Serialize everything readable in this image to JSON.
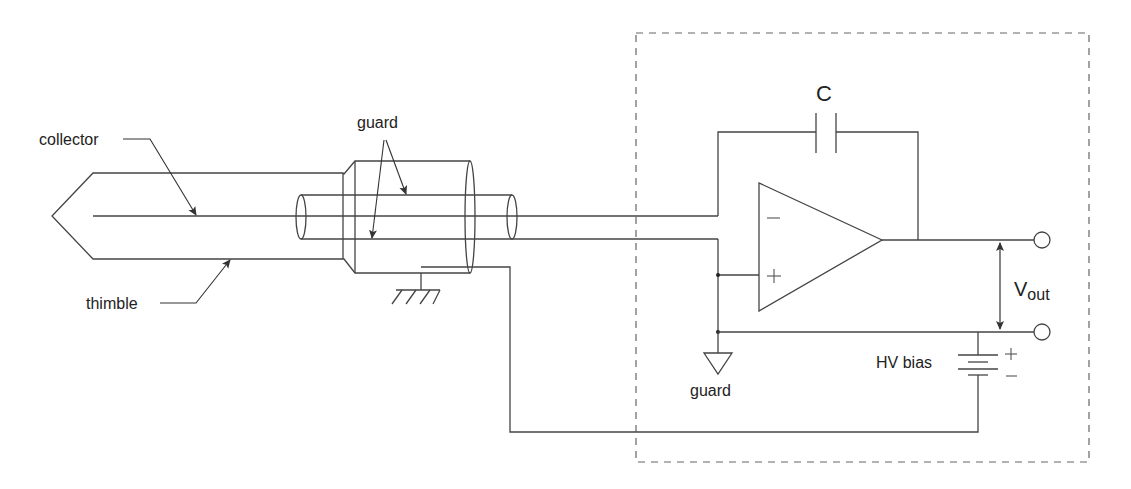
{
  "diagram": {
    "type": "circuit-schematic",
    "labels": {
      "collector": "collector",
      "thimble": "thimble",
      "guard_cable": "guard",
      "capacitor": "C",
      "opamp_minus": "−",
      "opamp_plus": "+",
      "guard_symbol": "guard",
      "vout_main": "V",
      "vout_sub": "out",
      "hv_bias": "HV bias",
      "battery_plus": "+",
      "battery_minus": "−"
    },
    "colors": {
      "line": "#444444",
      "text": "#222222",
      "dashed_box": "#666666",
      "background": "#ffffff"
    },
    "components": [
      {
        "id": "chamber",
        "name": "thimble ionization chamber"
      },
      {
        "id": "collector",
        "name": "collector electrode"
      },
      {
        "id": "triax",
        "name": "guarded cable / connector"
      },
      {
        "id": "earth",
        "name": "earth ground"
      },
      {
        "id": "opamp",
        "name": "operational amplifier"
      },
      {
        "id": "cap",
        "name": "feedback capacitor C"
      },
      {
        "id": "guard_gnd",
        "name": "guard reference symbol"
      },
      {
        "id": "battery",
        "name": "HV bias supply"
      },
      {
        "id": "out_top",
        "name": "output terminal +"
      },
      {
        "id": "out_bot",
        "name": "output terminal ref"
      },
      {
        "id": "enclosure",
        "name": "electrometer enclosure (dashed)"
      }
    ]
  }
}
